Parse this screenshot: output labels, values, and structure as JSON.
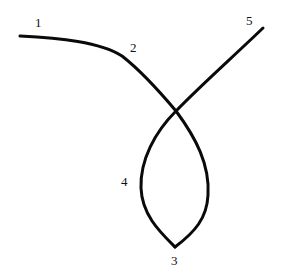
{
  "diagram": {
    "stroke_color": "#0a0a0a",
    "background": "#ffffff",
    "labels": [
      {
        "id": "1",
        "text": "1",
        "x": 35,
        "y": 27
      },
      {
        "id": "2",
        "text": "2",
        "x": 130,
        "y": 52
      },
      {
        "id": "3",
        "text": "3",
        "x": 173,
        "y": 265
      },
      {
        "id": "4",
        "text": "4",
        "x": 122,
        "y": 185
      },
      {
        "id": "5",
        "text": "5",
        "x": 247,
        "y": 24
      }
    ]
  }
}
